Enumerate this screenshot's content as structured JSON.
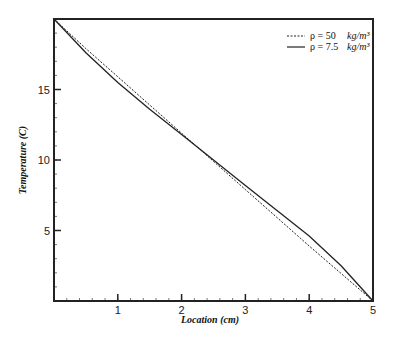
{
  "chart_data": {
    "type": "line",
    "title": "",
    "xlabel": "Location (cm)",
    "ylabel": "Temperature (C)",
    "xlim": [
      0,
      5
    ],
    "ylim": [
      0,
      20
    ],
    "xticks": [
      1,
      2,
      3,
      4,
      5
    ],
    "yticks": [
      5,
      10,
      15
    ],
    "x_minor_step": 0.2,
    "y_minor_step": 1,
    "grid": false,
    "legend_position": "upper right",
    "series": [
      {
        "name": "ρ = 50",
        "unit": "kg/m³",
        "style": "dashed",
        "x": [
          0,
          0.5,
          1,
          1.5,
          2,
          2.5,
          3,
          3.5,
          4,
          4.5,
          5
        ],
        "y": [
          20,
          17.9,
          15.9,
          13.9,
          11.9,
          9.9,
          7.9,
          5.9,
          3.9,
          1.95,
          0
        ]
      },
      {
        "name": "ρ = 7.5",
        "unit": "kg/m³",
        "style": "solid",
        "x": [
          0,
          0.5,
          1,
          1.5,
          2,
          2.5,
          3,
          3.5,
          4,
          4.5,
          5
        ],
        "y": [
          20,
          17.6,
          15.5,
          13.6,
          11.8,
          10.0,
          8.2,
          6.4,
          4.6,
          2.5,
          0
        ]
      }
    ]
  }
}
